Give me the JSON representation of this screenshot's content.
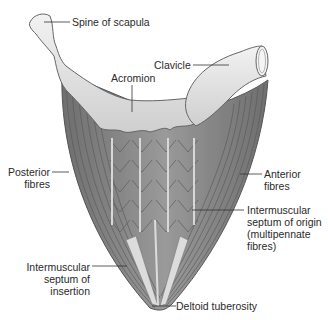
{
  "figure": {
    "labels": {
      "spine_of_scapula": "Spine of scapula",
      "clavicle": "Clavicle",
      "acromion": "Acromion",
      "posterior_fibres_1": "Posterior",
      "posterior_fibres_2": "fibres",
      "anterior_fibres_1": "Anterior",
      "anterior_fibres_2": "fibres",
      "septum_origin_1": "Intermuscular",
      "septum_origin_2": "septum of origin",
      "septum_origin_3": "(multipennate",
      "septum_origin_4": "fibres)",
      "septum_insertion_1": "Intermuscular",
      "septum_insertion_2": "septum of",
      "septum_insertion_3": "insertion",
      "deltoid_tuberosity": "Deltoid tuberosity"
    },
    "colors": {
      "muscle": "#8a8a8a",
      "muscle_dark": "#5e5e5e",
      "bone": "#e6e6e6",
      "tendon": "#dcdcdc",
      "leader": "#333333"
    }
  }
}
